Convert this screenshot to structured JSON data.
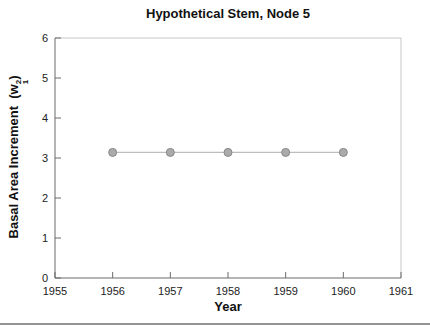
{
  "figure": {
    "separator_color": "#949494"
  },
  "chart_data": {
    "type": "line",
    "title": "Hypothetical Stem, Node 5",
    "xlabel": "Year",
    "ylabel": {
      "text": "Basal Area Increment",
      "paren_open": "(w",
      "sub": "1",
      "sup": "2",
      "paren_close": ")"
    },
    "x": [
      1956,
      1957,
      1958,
      1959,
      1960
    ],
    "y": [
      3.14,
      3.14,
      3.14,
      3.14,
      3.14
    ],
    "xlim": [
      1955,
      1961
    ],
    "ylim": [
      0,
      6
    ],
    "xticks": [
      1955,
      1956,
      1957,
      1958,
      1959,
      1960,
      1961
    ],
    "yticks": [
      0,
      1,
      2,
      3,
      4,
      5,
      6
    ],
    "grid": false,
    "legend": null,
    "line_color": "#bdbdbd",
    "marker_fill": "#ababab",
    "marker_edge": "#878787",
    "axis_color": "#6b6b6b",
    "box_color": "#c6c6c6",
    "tick_label_color": "#222222"
  }
}
